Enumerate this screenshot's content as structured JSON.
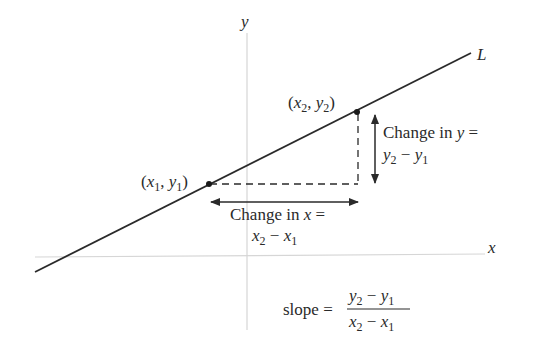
{
  "axes": {
    "x_label": "x",
    "y_label": "y"
  },
  "line": {
    "label": "L"
  },
  "points": [
    {
      "var_x": "x",
      "sub_x": "1",
      "var_y": "y",
      "sub_y": "1"
    },
    {
      "var_x": "x",
      "sub_x": "2",
      "var_y": "y",
      "sub_y": "2"
    }
  ],
  "annotations": {
    "change_y": {
      "line1_prefix": "Change in ",
      "line1_var": "y",
      "line1_suffix": " =",
      "a": "y",
      "a_sub": "2",
      "minus": " − ",
      "b": "y",
      "b_sub": "1"
    },
    "change_x": {
      "line1_prefix": "Change in ",
      "line1_var": "x",
      "line1_suffix": " =",
      "a": "x",
      "a_sub": "2",
      "minus": " − ",
      "b": "x",
      "b_sub": "1"
    }
  },
  "formula": {
    "lhs": "slope =",
    "num_a": "y",
    "num_a_sub": "2",
    "num_minus": " − ",
    "num_b": "y",
    "num_b_sub": "1",
    "den_a": "x",
    "den_a_sub": "2",
    "den_minus": " − ",
    "den_b": "x",
    "den_b_sub": "1"
  },
  "colors": {
    "line": "#2a2a2a",
    "axis": "#d9d9d9",
    "text": "#2a2a2a"
  }
}
